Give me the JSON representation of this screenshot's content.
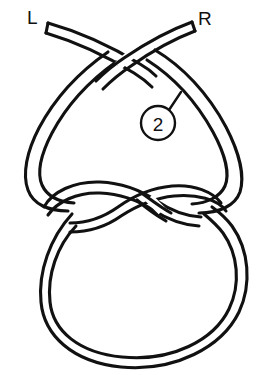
{
  "figure": {
    "background_color": "#ffffff",
    "line_color": "#111111",
    "width": 263,
    "height": 375
  },
  "labels": {
    "left_end": "L",
    "right_end": "R"
  },
  "callout": {
    "number": "2",
    "shape": "circle",
    "center_x": 158,
    "center_y": 123,
    "radius": 17,
    "leader_from_x": 169,
    "leader_from_y": 110,
    "leader_to_x": 180,
    "leader_to_y": 93
  },
  "structure": {
    "parts": [
      {
        "name": "left-working-end",
        "description": "Rope end at upper left labelled L"
      },
      {
        "name": "right-working-end",
        "description": "Rope end at upper right labelled R"
      },
      {
        "name": "upper-crossing",
        "description": "Ends cross near top centre forming heart-shaped bight"
      },
      {
        "name": "heart-loop",
        "description": "Large inverted teardrop loop below the crossing"
      },
      {
        "name": "twist-crossing",
        "description": "Figure-eight twist across the middle of the drawing"
      },
      {
        "name": "bottom-loop",
        "description": "Large round loop at the bottom"
      }
    ]
  }
}
